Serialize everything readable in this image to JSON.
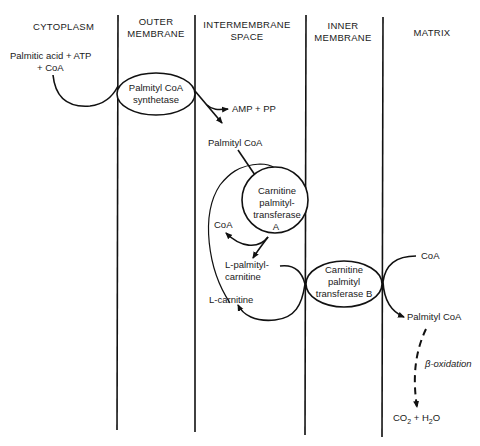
{
  "headers": {
    "cytoplasm": "CYTOPLASM",
    "outer_membrane_1": "OUTER",
    "outer_membrane_2": "MEMBRANE",
    "intermembrane_1": "INTERMEMBRANE",
    "intermembrane_2": "SPACE",
    "inner_membrane_1": "INNER",
    "inner_membrane_2": "MEMBRANE",
    "matrix": "MATRIX"
  },
  "reactants": {
    "line1": "Palmitic acid + ATP",
    "line2": "+ CoA"
  },
  "enzymes": {
    "synthetase_1": "Palmityl CoA",
    "synthetase_2": "synthetase",
    "cpt_a_1": "Carnitine",
    "cpt_a_2": "palmityl-",
    "cpt_a_3": "transferase",
    "cpt_a_4": "A",
    "cpt_b_1": "Carnitine",
    "cpt_b_2": "palmityl",
    "cpt_b_3": "transferase B"
  },
  "labels": {
    "amp_pp": "AMP + PP",
    "palmityl_coa_ims": "Palmityl CoA",
    "coa_ims": "CoA",
    "l_palmityl_1": "L-palmityl-",
    "l_palmityl_2": "carnitine",
    "l_carnitine": "L-carnitine",
    "coa_matrix": "CoA",
    "palmityl_coa_matrix": "Palmityl CoA",
    "beta_oxidation": "β-oxidation",
    "co2": "CO",
    "co2_sub": "2",
    "plus_h": " + H",
    "h2o_sub": "2",
    "o": "O"
  }
}
